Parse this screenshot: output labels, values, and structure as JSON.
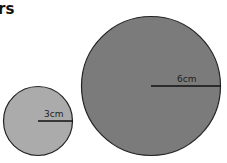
{
  "title": "rs",
  "circles": [
    {
      "name": "small-circle",
      "radius_label": "3cm",
      "fill": "#aaaaaa",
      "stroke": "#222222"
    },
    {
      "name": "large-circle",
      "radius_label": "6cm",
      "fill": "#7a7a7a",
      "stroke": "#222222"
    }
  ]
}
